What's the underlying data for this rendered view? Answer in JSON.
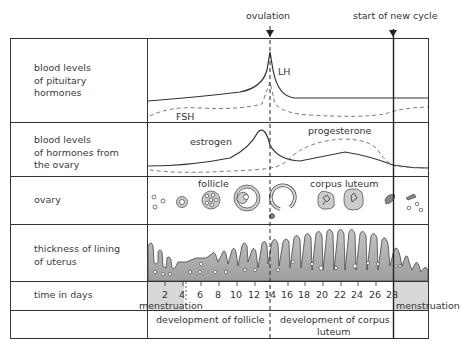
{
  "markers": {
    "ovulation": "ovulation",
    "new_cycle": "start of new cycle"
  },
  "rows": [
    {
      "label": "blood levels\nof pituitary\nhormones"
    },
    {
      "label": "blood levels\nof hormones from\nthe ovary"
    },
    {
      "label": "ovary"
    },
    {
      "label": "thickness of lining\nof uterus"
    },
    {
      "label": "time in days"
    },
    {
      "label": ""
    }
  ],
  "hormones": {
    "lh": "LH",
    "fsh": "FSH",
    "estrogen": "estrogen",
    "progesterone": "progesterone"
  },
  "ovary": {
    "follicle": "follicle",
    "corpus_luteum": "corpus luteum"
  },
  "time": {
    "ticks": [
      "2",
      "4",
      "6",
      "8",
      "10",
      "12",
      "14",
      "16",
      "18",
      "20",
      "22",
      "24",
      "26",
      "28"
    ],
    "menstruation_start": "menstruation",
    "menstruation_end": "menstruation"
  },
  "phases": {
    "follicle": "development of follicle",
    "corpus_luteum_1": "development of corpus",
    "corpus_luteum_2": "luteum"
  },
  "colors": {
    "line": "#333333",
    "fill": "#b5b5b5",
    "shade": "#d9d9d9"
  }
}
